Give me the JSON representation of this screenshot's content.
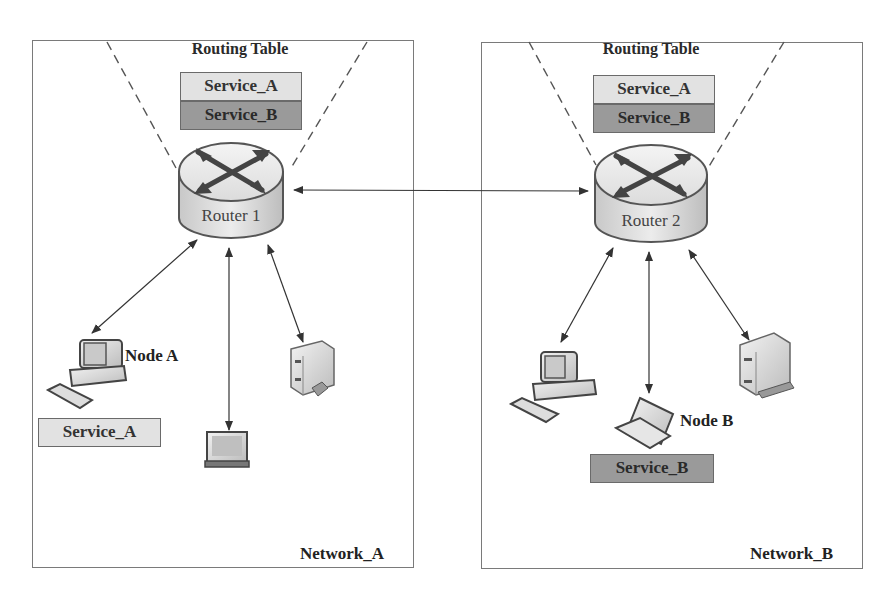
{
  "diagram": {
    "type": "network-topology",
    "networks": [
      {
        "id": "network_a",
        "label": "Network_A",
        "router": {
          "label": "Router 1",
          "routing_table": {
            "title": "Routing Table",
            "entries": [
              "Service_A",
              "Service_B"
            ]
          }
        },
        "devices": [
          {
            "type": "desktop-computer",
            "label": "Node A",
            "service": "Service_A"
          },
          {
            "type": "laptop",
            "label": ""
          },
          {
            "type": "server",
            "label": ""
          }
        ]
      },
      {
        "id": "network_b",
        "label": "Network_B",
        "router": {
          "label": "Router 2",
          "routing_table": {
            "title": "Routing Table",
            "entries": [
              "Service_A",
              "Service_B"
            ]
          }
        },
        "devices": [
          {
            "type": "desktop-computer",
            "label": ""
          },
          {
            "type": "laptop",
            "label": "Node B",
            "service": "Service_B"
          },
          {
            "type": "server",
            "label": ""
          }
        ]
      }
    ],
    "links": [
      {
        "from": "Router 1",
        "to": "Router 2",
        "bidirectional": true
      },
      {
        "from": "Router 1",
        "to": "Node A",
        "bidirectional": true
      },
      {
        "from": "Router 1",
        "to": "laptop (Network_A)",
        "bidirectional": true
      },
      {
        "from": "Router 1",
        "to": "server (Network_A)",
        "bidirectional": true
      },
      {
        "from": "Router 2",
        "to": "desktop (Network_B)",
        "bidirectional": true
      },
      {
        "from": "Router 2",
        "to": "Node B",
        "bidirectional": true
      },
      {
        "from": "Router 2",
        "to": "server (Network_B)",
        "bidirectional": true
      }
    ],
    "colors": {
      "service_a_fill": "#e2e2e2",
      "service_b_fill": "#9a9a9a",
      "border": "#7a7a7a",
      "arrow": "#333333"
    }
  }
}
